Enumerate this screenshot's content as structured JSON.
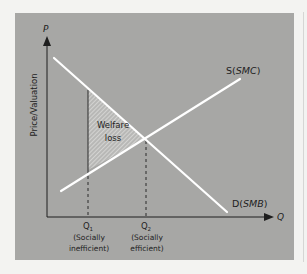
{
  "diagram": {
    "type": "economics-externality",
    "axes": {
      "y_symbol": "P",
      "y_label": "Price/Valuation",
      "x_symbol": "Q"
    },
    "curves": {
      "supply_label_prefix": "S(",
      "supply_label_italic": "SMC",
      "supply_label_suffix": ")",
      "demand_label_prefix": "D(",
      "demand_label_italic": "SMB",
      "demand_label_suffix": ")"
    },
    "region": {
      "line1": "Welfare",
      "line2": "loss"
    },
    "quantities": [
      {
        "symbol": "Q",
        "subscript": "1",
        "line1": "(Socially",
        "line2": "inefficient)"
      },
      {
        "symbol": "Q",
        "subscript": "2",
        "line1": "(Socially",
        "line2": "efficient)"
      }
    ],
    "colors": {
      "background": "#f3f3f1",
      "panel": "#a7a7a5",
      "curve": "#ffffff",
      "axis": "#1e1e1e",
      "hatch": "#e8e8e6"
    }
  }
}
